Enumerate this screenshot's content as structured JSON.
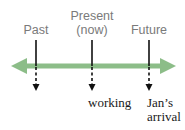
{
  "timeline": {
    "colors": {
      "axis": "#8cbd88",
      "marker": "#111111",
      "top_label": "#7a7a7a",
      "bottom_label": "#1a1a1a"
    },
    "markers": [
      {
        "id": "past",
        "label_line1": "Past",
        "label_line2": ""
      },
      {
        "id": "present",
        "label_line1": "Present",
        "label_line2": "(now)"
      },
      {
        "id": "future",
        "label_line1": "Future",
        "label_line2": ""
      }
    ],
    "events": [
      {
        "marker": "present",
        "label_line1": "working",
        "label_line2": ""
      },
      {
        "marker": "future",
        "label_line1": "Jan’s",
        "label_line2": "arrival"
      }
    ]
  }
}
